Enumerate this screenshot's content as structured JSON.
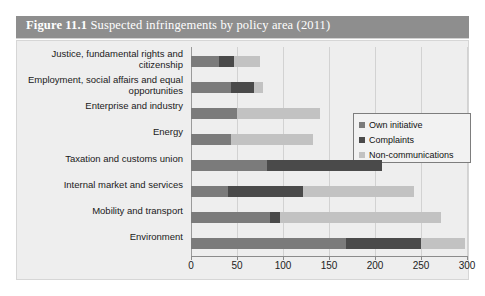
{
  "figure": {
    "number": "Figure 11.1",
    "caption": "Suspected infringements by policy area (2011)"
  },
  "legend": {
    "position": "top-right",
    "items": [
      {
        "label": "Own initiative",
        "color": "#7b7b7b",
        "key": "own"
      },
      {
        "label": "Complaints",
        "color": "#4a4a4a",
        "key": "complaints"
      },
      {
        "label": "Non-communications",
        "color": "#c2c2c2",
        "key": "noncomm"
      }
    ]
  },
  "axis": {
    "ticks": [
      "0",
      "50",
      "100",
      "150",
      "200",
      "250",
      "300"
    ]
  },
  "chart_data": {
    "type": "bar",
    "orientation": "horizontal",
    "stacked": true,
    "title": "Suspected infringements by policy area (2011)",
    "xlabel": "",
    "ylabel": "",
    "xlim": [
      0,
      300
    ],
    "xticks": [
      0,
      50,
      100,
      150,
      200,
      250,
      300
    ],
    "grid": true,
    "legend_position": "top-right",
    "categories": [
      "Justice, fundamental rights and citizenship",
      "Employment, social affairs and equal opportunities",
      "Enterprise and industry",
      "Energy",
      "Taxation and customs union",
      "Internal market and services",
      "Mobility and transport",
      "Environment"
    ],
    "series": [
      {
        "name": "Own initiative",
        "color": "#7b7b7b",
        "values": [
          30,
          43,
          50,
          43,
          83,
          40,
          86,
          168
        ]
      },
      {
        "name": "Complaints",
        "color": "#4a4a4a",
        "values": [
          17,
          25,
          0,
          0,
          125,
          82,
          11,
          82
        ]
      },
      {
        "name": "Non-communications",
        "color": "#c2c2c2",
        "values": [
          28,
          10,
          90,
          90,
          0,
          120,
          175,
          48
        ]
      }
    ],
    "totals": [
      75,
      78,
      140,
      133,
      208,
      242,
      272,
      298
    ]
  }
}
